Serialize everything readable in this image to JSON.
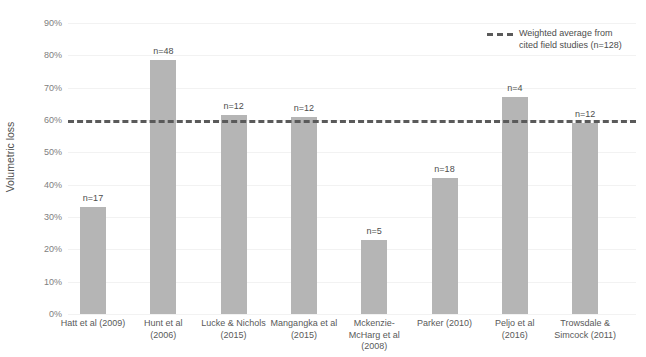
{
  "chart_data": {
    "type": "bar",
    "title": "",
    "xlabel": "",
    "ylabel": "Volumetric loss",
    "ylim": [
      0,
      90
    ],
    "ytick_labels": [
      "90%",
      "80%",
      "70%",
      "60%",
      "50%",
      "40%",
      "30%",
      "20%",
      "10%",
      "0%"
    ],
    "ytick_values": [
      90,
      80,
      70,
      60,
      50,
      40,
      30,
      20,
      10,
      0
    ],
    "grid": true,
    "legend_position": "top-right",
    "categories": [
      "Hatt et al (2009)",
      "Hunt et al\n(2006)",
      "Lucke & Nichols\n(2015)",
      "Mangangka et al\n(2015)",
      "Mckenzie-\nMcHarg et al\n(2008)",
      "Parker (2010)",
      "Peljo et al\n(2016)",
      "Trowsdale &\nSimcock (2011)"
    ],
    "values": [
      33,
      78.5,
      61.5,
      61,
      23,
      42,
      67,
      59
    ],
    "point_labels": [
      "n=17",
      "n=48",
      "n=12",
      "n=12",
      "n=5",
      "n=18",
      "n=4",
      "n=12"
    ],
    "annotations": [
      {
        "name": "weighted-average",
        "value": 60,
        "style": "dashed",
        "label": "Weighted average from\ncited field studies (n=128)"
      }
    ],
    "series": [
      {
        "name": "Volumetric loss",
        "values": [
          33,
          78.5,
          61.5,
          61,
          23,
          42,
          67,
          59
        ]
      }
    ],
    "colors": {
      "bar": "#b5b5b5",
      "average_line": "#5a5a5a",
      "gridline": "#f2f2f2",
      "text": "#595959"
    }
  },
  "legend": {
    "entry_label": "Weighted average from\ncited field studies (n=128)"
  },
  "axis": {
    "y_title": "Volumetric loss"
  }
}
